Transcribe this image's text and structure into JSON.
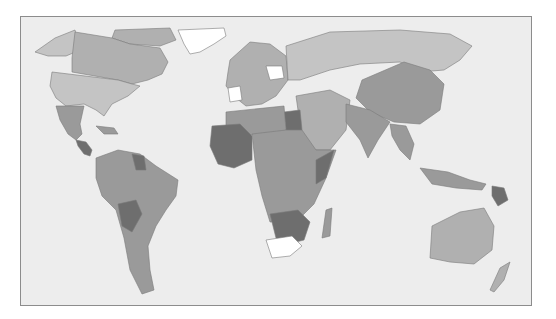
{
  "map": {
    "type": "choropleth",
    "projection": "robinson-like world map",
    "colors": {
      "ocean": "#ededed",
      "frame_border": "#8c8c8c",
      "level_none": "#ffffff",
      "level_1": "#c4c4c4",
      "level_2": "#b0b0b0",
      "level_3": "#9a9a9a",
      "level_4": "#6e6e6e"
    },
    "regions": [
      {
        "name": "Greenland",
        "level": "level_none"
      },
      {
        "name": "Alaska / USA",
        "level": "level_1"
      },
      {
        "name": "Canada",
        "level": "level_2"
      },
      {
        "name": "Mexico",
        "level": "level_3"
      },
      {
        "name": "Central America (Guatemala, Honduras, Nicaragua)",
        "level": "level_4"
      },
      {
        "name": "South America",
        "level": "level_3"
      },
      {
        "name": "Guyana / Suriname",
        "level": "level_4"
      },
      {
        "name": "Bolivia",
        "level": "level_4"
      },
      {
        "name": "Europe",
        "level": "level_2"
      },
      {
        "name": "Eastern Europe (partial)",
        "level": "level_none"
      },
      {
        "name": "Russia",
        "level": "level_1"
      },
      {
        "name": "Middle East",
        "level": "level_2"
      },
      {
        "name": "Egypt",
        "level": "level_4"
      },
      {
        "name": "North Africa",
        "level": "level_3"
      },
      {
        "name": "West Africa / Sahel",
        "level": "level_4"
      },
      {
        "name": "Central / East Africa",
        "level": "level_3"
      },
      {
        "name": "Southern Africa (Zambia, Zimbabwe, Mozambique, Botswana)",
        "level": "level_4"
      },
      {
        "name": "South Africa",
        "level": "level_none"
      },
      {
        "name": "Madagascar",
        "level": "level_3"
      },
      {
        "name": "China / Mongolia",
        "level": "level_3"
      },
      {
        "name": "India / South Asia",
        "level": "level_3"
      },
      {
        "name": "Southeast Asia",
        "level": "level_3"
      },
      {
        "name": "Papua New Guinea",
        "level": "level_4"
      },
      {
        "name": "Australia",
        "level": "level_2"
      },
      {
        "name": "New Zealand",
        "level": "level_2"
      }
    ]
  }
}
